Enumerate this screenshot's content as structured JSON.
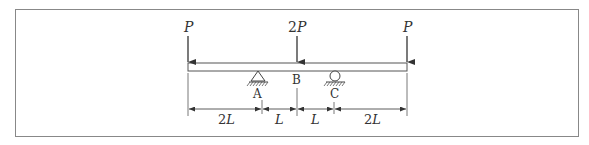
{
  "diagram": {
    "type": "beam-loading",
    "loads": [
      {
        "label": "P",
        "x_pos": "left end"
      },
      {
        "label": "2P",
        "x_pos": "B"
      },
      {
        "label": "P",
        "x_pos": "right end"
      }
    ],
    "supports": [
      {
        "label": "A",
        "kind": "pin"
      },
      {
        "label": "C",
        "kind": "roller"
      }
    ],
    "points": [
      {
        "label": "B"
      }
    ],
    "dimensions": [
      "2L",
      "L",
      "L",
      "2L"
    ],
    "colors": {
      "line": "#444444",
      "frame": "#888888",
      "beam_fill": "#ffffff"
    }
  }
}
